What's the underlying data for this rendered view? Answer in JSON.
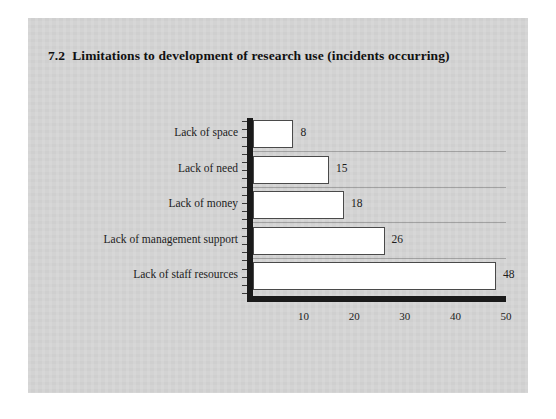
{
  "page": {
    "background_color": "#ffffff",
    "panel_color": "#d5d5d5"
  },
  "chart_data": {
    "type": "bar",
    "orientation": "horizontal",
    "title_number": "7.2",
    "title_text": "Limitations to development of research use (incidents occurring)",
    "categories": [
      "Lack of space",
      "Lack of need",
      "Lack of money",
      "Lack of management support",
      "Lack of staff resources"
    ],
    "values": [
      8,
      15,
      18,
      26,
      48
    ],
    "data_labels": [
      "8",
      "15",
      "18",
      "26",
      "48"
    ],
    "xlabel": "",
    "ylabel": "",
    "xlim": [
      0,
      50
    ],
    "xticks": [
      10,
      20,
      30,
      40,
      50
    ],
    "xtick_labels": [
      "10",
      "20",
      "30",
      "40",
      "50"
    ],
    "grid": false,
    "legend": false,
    "bar_fill_color": "#ffffff",
    "bar_edge_color": "#4a4a4a",
    "axis_color": "#1a1a1a"
  }
}
